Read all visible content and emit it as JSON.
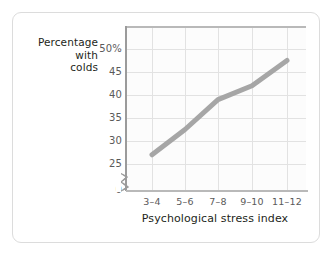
{
  "figure": {
    "background_color": "#ffffff",
    "border_color": "#dcdcdc"
  },
  "chart_data": {
    "type": "line",
    "title": "",
    "xlabel": "Psychological stress index",
    "ylabel": "Percentage with colds",
    "ylabel_lines": [
      "Percentage",
      "with",
      "colds"
    ],
    "categories": [
      "3–4",
      "5–6",
      "7–8",
      "9–10",
      "11–12"
    ],
    "values": [
      27,
      32.5,
      39,
      42,
      47.5
    ],
    "series": [
      {
        "name": "Percentage with colds",
        "values": [
          27,
          32.5,
          39,
          42,
          47.5
        ],
        "color": "#a6a6a6",
        "line_width": 5
      }
    ],
    "ylim": [
      25,
      50
    ],
    "y_ticks": [
      25,
      30,
      35,
      40,
      45,
      50
    ],
    "y_tick_labels": [
      "25",
      "30",
      "35",
      "40",
      "45",
      "50%"
    ],
    "y_zero_label": "0",
    "axis_break": true,
    "axis_break_icon": "axis-break-zigzag",
    "grid": true,
    "grid_color": "#e2e2e2",
    "legend": null,
    "legend_position": "none"
  },
  "axes": {
    "y_title_line_1": "Percentage",
    "y_title_line_2": "with",
    "y_title_line_3": "colds",
    "y_tick_50": "50%",
    "y_tick_45": "45",
    "y_tick_40": "40",
    "y_tick_35": "35",
    "y_tick_30": "30",
    "y_tick_25": "25",
    "y_tick_0": "0",
    "x_tick_1": "3–4",
    "x_tick_2": "5–6",
    "x_tick_3": "7–8",
    "x_tick_4": "9–10",
    "x_tick_5": "11–12",
    "x_title": "Psychological stress index"
  }
}
